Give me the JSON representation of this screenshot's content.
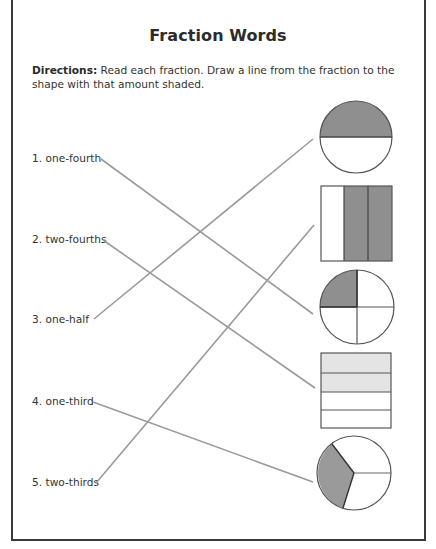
{
  "worksheet": {
    "title": "Fraction Words",
    "directions_lead": "Directions:",
    "directions_text": "Read each fraction. Draw a line from the fraction to the shape with that amount shaded."
  },
  "fractions": [
    {
      "number": "1.",
      "label": "1. one-fourth",
      "matches_shape": "circle-quarters"
    },
    {
      "number": "2.",
      "label": "2. two-fourths",
      "matches_shape": "rect-rows-fourths"
    },
    {
      "number": "3.",
      "label": "3. one-half",
      "matches_shape": "circle-halves"
    },
    {
      "number": "4.",
      "label": "4. one-third",
      "matches_shape": "circle-thirds"
    },
    {
      "number": "5.",
      "label": "5. two-thirds",
      "matches_shape": "rect-columns-thirds"
    }
  ],
  "shapes": [
    {
      "id": "circle-halves",
      "kind": "circle",
      "parts": 2,
      "shaded": 1
    },
    {
      "id": "rect-columns-thirds",
      "kind": "rectangle",
      "parts": 3,
      "shaded": 2
    },
    {
      "id": "circle-quarters",
      "kind": "circle",
      "parts": 4,
      "shaded": 1
    },
    {
      "id": "rect-rows-fourths",
      "kind": "rectangle",
      "parts": 4,
      "shaded": 2
    },
    {
      "id": "circle-thirds",
      "kind": "circle",
      "parts": 3,
      "shaded": 1
    }
  ],
  "colors": {
    "dark_shade": "#8f8f8f",
    "light_shade": "#e4e4e4",
    "line": "#9a9a9a",
    "outline": "#555555",
    "border": "#3a3a3a"
  }
}
